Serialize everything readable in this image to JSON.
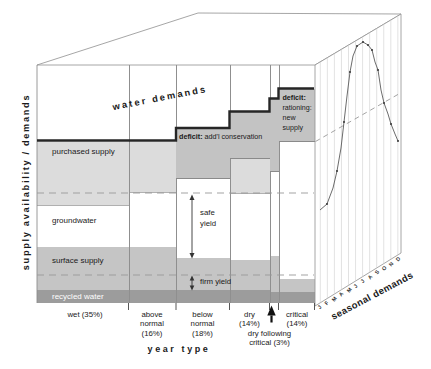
{
  "diagram": {
    "y_axis_label": "supply availability / demands",
    "x_axis_label": "year type",
    "water_demands_label": "water demands",
    "supply_layers": [
      "purchased supply",
      "groundwater",
      "surface supply",
      "recycled water"
    ],
    "year_types": [
      {
        "id": "wet",
        "label_lines": [
          "wet (35%)"
        ]
      },
      {
        "id": "above-normal",
        "label_lines": [
          "above",
          "normal",
          "(16%)"
        ]
      },
      {
        "id": "below-normal",
        "label_lines": [
          "below",
          "normal",
          "(18%)"
        ]
      },
      {
        "id": "dry",
        "label_lines": [
          "dry",
          "(14%)"
        ]
      },
      {
        "id": "dry-following-critical",
        "label_lines": [
          "dry following",
          "critical (3%)"
        ]
      },
      {
        "id": "critical",
        "label_lines": [
          "critical",
          "(14%)"
        ]
      }
    ],
    "deficit_conservation": {
      "bold": "deficit:",
      "rest": "add'l conservation"
    },
    "deficit_rationing": {
      "bold": "deficit:",
      "lines": [
        "rationing:",
        "new",
        "supply"
      ]
    },
    "safe_yield_lines": [
      "safe",
      "yield"
    ],
    "firm_yield_label": "firm yield",
    "side_panel": {
      "label": "seasonal demands",
      "months": [
        "J",
        "F",
        "M",
        "A",
        "M",
        "J",
        "J",
        "A",
        "S",
        "O",
        "N",
        "D"
      ],
      "curve_points": [
        [
          320,
          210
        ],
        [
          327,
          204
        ],
        [
          333,
          188
        ],
        [
          337,
          171
        ],
        [
          341,
          148
        ],
        [
          344,
          122
        ],
        [
          347,
          96
        ],
        [
          350,
          72
        ],
        [
          353,
          56
        ],
        [
          357,
          46
        ],
        [
          363,
          42
        ],
        [
          368,
          45
        ],
        [
          372,
          50
        ],
        [
          375,
          62
        ],
        [
          378,
          70
        ],
        [
          381,
          90
        ],
        [
          384,
          103
        ],
        [
          388,
          114
        ],
        [
          391,
          124
        ],
        [
          395,
          134
        ],
        [
          398,
          141
        ]
      ],
      "curve_marker_points": [
        [
          327,
          204
        ],
        [
          337,
          171
        ],
        [
          344,
          122
        ],
        [
          350,
          72
        ],
        [
          357,
          46
        ],
        [
          363,
          42
        ],
        [
          368,
          45
        ],
        [
          372,
          50
        ],
        [
          378,
          70
        ],
        [
          384,
          103
        ],
        [
          391,
          124
        ],
        [
          398,
          141
        ]
      ]
    },
    "colors": {
      "purchased": "#dcdcdc",
      "groundwater": "#ffffff",
      "surface": "#c5c5c5",
      "recycled": "#9c9c9c",
      "deficit": "#c3c3c3",
      "demand_line": "#262626",
      "dashed_line": "#999999",
      "frame": "#8f8f8f",
      "curve": "#5a5a5a",
      "text": "#1a1a1a"
    }
  }
}
